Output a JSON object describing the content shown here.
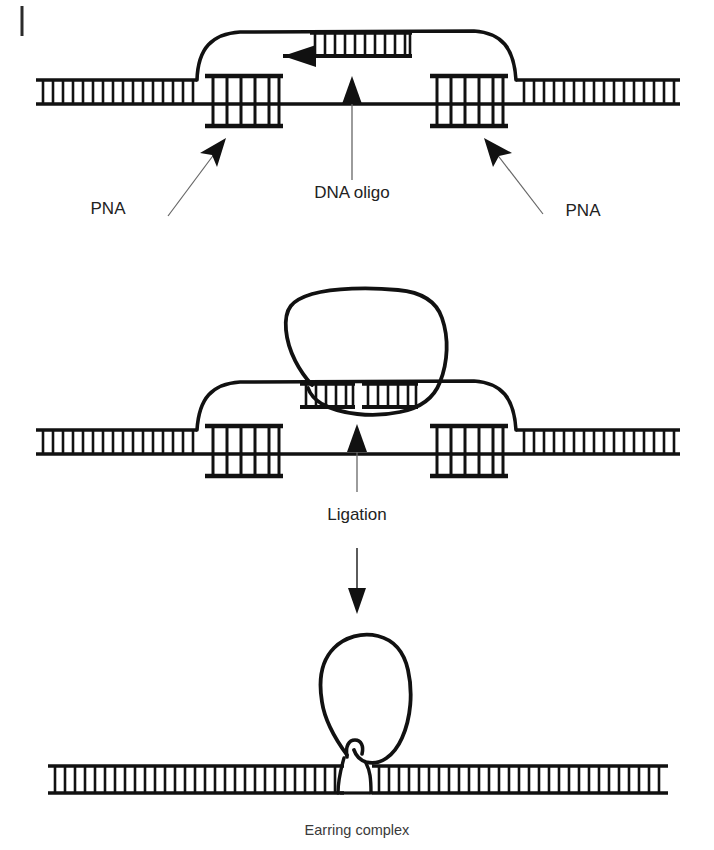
{
  "figure": {
    "background_color": "#ffffff",
    "ink_color": "#111111",
    "thin_line_color": "#555555",
    "width": 714,
    "height": 850
  },
  "panels": [
    {
      "id": "panel-top",
      "name": "pna-opened-duplex-with-dna-oligo",
      "description": "Duplex DNA opened by two PNA clamps; displaced strand loops over a hybridized DNA oligo",
      "labels": [
        {
          "id": "pna-left",
          "text": "PNA",
          "x": 108,
          "y": 212,
          "arrow": "up-right"
        },
        {
          "id": "dna-oligo",
          "text": "DNA oligo",
          "x": 306,
          "y": 198,
          "arrow": "up"
        },
        {
          "id": "pna-right",
          "text": "PNA",
          "x": 556,
          "y": 214,
          "arrow": "up-left"
        }
      ],
      "elements": {
        "duplex_rungs": 46,
        "pna_left_rungs": 6,
        "pna_right_rungs": 6,
        "oligo_rungs": 11,
        "oligo_arrow_direction": "left"
      }
    },
    {
      "id": "panel-middle",
      "name": "ligation-intermediate",
      "description": "Large circular loop of the ligated oligo hybridized to the displaced strand above the duplex",
      "labels": [
        {
          "id": "ligation",
          "text": "Ligation",
          "x": 357,
          "y": 520,
          "arrow": "up"
        }
      ],
      "elements": {
        "duplex_rungs": 46,
        "pna_left_rungs": 6,
        "pna_right_rungs": 6,
        "oligo_rungs_left": 5,
        "oligo_rungs_right": 5,
        "nick_present": true
      }
    },
    {
      "id": "panel-bottom",
      "name": "earring-complex",
      "description": "Closed circular earring loop catenated to the restored duplex",
      "labels": [
        {
          "id": "earring-complex",
          "text": "Earring complex",
          "x": 357,
          "y": 833,
          "arrow": "none"
        }
      ],
      "elements": {
        "duplex_rungs": 56,
        "loop_closed": true
      }
    }
  ],
  "flow": {
    "steps": [
      {
        "from": "panel-top",
        "to": "panel-middle",
        "label": ""
      },
      {
        "from": "panel-middle",
        "to": "panel-bottom",
        "label": "Ligation"
      }
    ],
    "ligation_arrow": {
      "x": 357,
      "y_start": 548,
      "y_end": 612,
      "direction": "down"
    }
  },
  "marks": {
    "page_rule": {
      "x": 22,
      "y_start": 6,
      "y_end": 36,
      "name": "page-edge-rule"
    }
  }
}
